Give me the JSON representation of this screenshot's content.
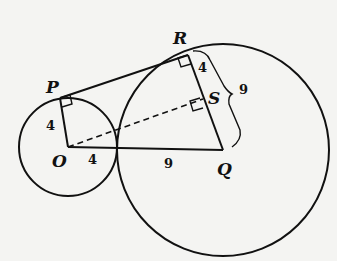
{
  "diagram": {
    "type": "geometry",
    "points": {
      "P": "P",
      "R": "R",
      "S": "S",
      "O": "O",
      "Q": "Q"
    },
    "measures": {
      "OP": "4",
      "RS": "4",
      "OT": "4",
      "TQ": "9",
      "RQ_brace": "9"
    },
    "colors": {
      "stroke": "#111111",
      "background": "#f4f4f2"
    }
  }
}
